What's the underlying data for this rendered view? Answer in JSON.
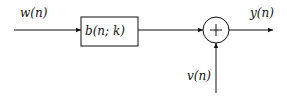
{
  "diagram": {
    "type": "block-diagram",
    "input_label": "w(n)",
    "block_label": "b(n; k)",
    "summer_symbol": "+",
    "noise_label": "v(n)",
    "output_label": "y(n)",
    "colors": {
      "stroke": "#111111",
      "background": "#ffffff"
    }
  }
}
